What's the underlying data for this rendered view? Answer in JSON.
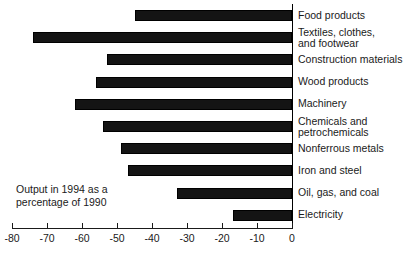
{
  "chart_data": {
    "type": "bar",
    "orientation": "horizontal",
    "title": "",
    "subtitle": "",
    "xlabel": "",
    "ylabel": "",
    "annotation_lines": [
      "Output in 1994 as a",
      "percentage of 1990"
    ],
    "categories": [
      "Food products",
      "Textiles, clothes, and footwear",
      "Construction materials",
      "Wood products",
      "Machinery",
      "Chemicals and petrochemicals",
      "Nonferrous metals",
      "Iron and steel",
      "Oil, gas, and coal",
      "Electricity"
    ],
    "category_label_lines": [
      [
        "Food products"
      ],
      [
        "Textiles, clothes,",
        "and footwear"
      ],
      [
        "Construction materials"
      ],
      [
        "Wood products"
      ],
      [
        "Machinery"
      ],
      [
        "Chemicals and",
        "petrochemicals"
      ],
      [
        "Nonferrous metals"
      ],
      [
        "Iron and steel"
      ],
      [
        "Oil, gas, and coal"
      ],
      [
        "Electricity"
      ]
    ],
    "values": [
      -45,
      -74,
      -53,
      -56,
      -62,
      -54,
      -49,
      -47,
      -33,
      -17
    ],
    "xlim": [
      -80,
      0
    ],
    "xticks": [
      -80,
      -70,
      -60,
      -50,
      -40,
      -30,
      -20,
      -10,
      0
    ],
    "xtick_labels": [
      "-80",
      "-70",
      "-60",
      "-50",
      "-40",
      "-30",
      "-20",
      "-10",
      "0"
    ],
    "grid": false,
    "legend": null,
    "bar_color": "#141414",
    "axis_color": "#1a1a1a",
    "background_color": "#ffffff"
  }
}
